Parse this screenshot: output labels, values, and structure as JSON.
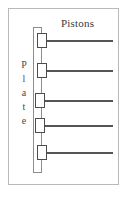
{
  "figure": {
    "type": "diagram",
    "title_label": "Pistons",
    "plate_label": "Plate",
    "plate_label_letters": [
      "P",
      "l",
      "a",
      "t",
      "e"
    ],
    "colors": {
      "frame_border": "#b9b9b9",
      "plate_border": "#8d8d8d",
      "block_border": "#4d4d4d",
      "rod": "#555555",
      "text": "#3a3a3a",
      "background": "#ffffff"
    },
    "geometry": {
      "frame": {
        "x": 8,
        "y": 8,
        "width": 111,
        "height": 177
      },
      "plate_bar": {
        "x": 33,
        "y": 27,
        "width": 9,
        "height": 146
      },
      "pistons_label_pos": {
        "x": 61,
        "y": 17
      },
      "plate_label_pos": {
        "x": 18,
        "y": 58
      }
    },
    "piston_count": 5,
    "pistons": [
      {
        "name": "piston-1",
        "block_x": 37,
        "block_y": 33,
        "rod_y": 40,
        "rod_x": 47,
        "rod_length": 66
      },
      {
        "name": "piston-2",
        "block_x": 37,
        "block_y": 63,
        "rod_y": 70,
        "rod_x": 47,
        "rod_length": 66
      },
      {
        "name": "piston-3",
        "block_x": 35,
        "block_y": 93,
        "rod_y": 100,
        "rod_x": 45,
        "rod_length": 68
      },
      {
        "name": "piston-4",
        "block_x": 35,
        "block_y": 118,
        "rod_y": 125,
        "rod_x": 45,
        "rod_length": 68
      },
      {
        "name": "piston-5",
        "block_x": 37,
        "block_y": 145,
        "rod_y": 152,
        "rod_x": 47,
        "rod_length": 66
      }
    ]
  }
}
